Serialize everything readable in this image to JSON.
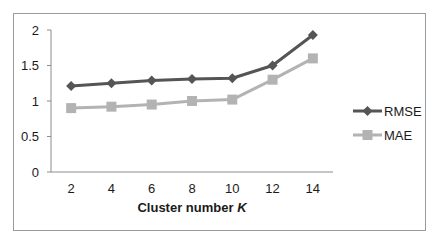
{
  "chart_data": {
    "type": "line",
    "title": "",
    "xlabel": "Cluster number K",
    "ylabel": "",
    "x": [
      2,
      4,
      6,
      8,
      10,
      12,
      14
    ],
    "categories": [
      "2",
      "4",
      "6",
      "8",
      "10",
      "12",
      "14"
    ],
    "ylim": [
      0,
      2
    ],
    "yticks": [
      "0",
      "0.5",
      "1",
      "1.5",
      "2"
    ],
    "grid": false,
    "legend_position": "right",
    "series": [
      {
        "name": "RMSE",
        "marker": "diamond",
        "color": "#555555",
        "values": [
          1.21,
          1.25,
          1.29,
          1.31,
          1.32,
          1.5,
          1.93
        ]
      },
      {
        "name": "MAE",
        "marker": "square",
        "color": "#b3b3b3",
        "values": [
          0.9,
          0.92,
          0.95,
          1.0,
          1.02,
          1.3,
          1.6
        ]
      }
    ]
  },
  "labels": {
    "xlabel_main": "Cluster number ",
    "xlabel_var": "K"
  }
}
